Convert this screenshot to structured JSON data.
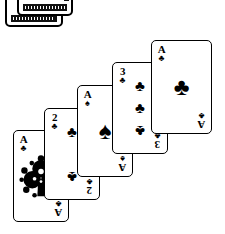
{
  "scene": {
    "title": "Fanned playing cards with deck box",
    "background_color": "#ffffff",
    "ink_color": "#000000",
    "style": "black-and-white line illustration"
  },
  "deck_box": {
    "name": "playing-card-deck-box",
    "description": "Two stacked card boxes at the top-left, cropped by the top image edge",
    "pip_glyphs": [
      "♣",
      "♣"
    ],
    "visible": true
  },
  "cards": [
    {
      "id": "card-1",
      "rank": "A",
      "suit": "clubs",
      "suit_glyph": "♣",
      "corner_rank": "A",
      "corner_suit": "♣",
      "pip_count": 1,
      "ornate": true,
      "position": {
        "left": 13,
        "top": 130,
        "width": 56,
        "height": 92
      },
      "z": 1
    },
    {
      "id": "card-2",
      "rank": "2",
      "suit": "clubs",
      "suit_glyph": "♣",
      "corner_rank": "2",
      "corner_suit": "♣",
      "pip_count": 2,
      "ornate": false,
      "position": {
        "left": 44,
        "top": 108,
        "width": 56,
        "height": 92
      },
      "z": 2
    },
    {
      "id": "card-3",
      "rank": "A",
      "suit": "spades",
      "suit_glyph": "♠",
      "corner_rank": "A",
      "corner_suit": "♠",
      "pip_count": 1,
      "ornate": false,
      "position": {
        "left": 77,
        "top": 85,
        "width": 56,
        "height": 92
      },
      "z": 3
    },
    {
      "id": "card-4",
      "rank": "3",
      "suit": "clubs",
      "suit_glyph": "♣",
      "corner_rank": "3",
      "corner_suit": "♣",
      "pip_count": 3,
      "ornate": false,
      "position": {
        "left": 112,
        "top": 62,
        "width": 56,
        "height": 92
      },
      "z": 4
    },
    {
      "id": "card-5",
      "rank": "A",
      "suit": "clubs",
      "suit_glyph": "♣",
      "corner_rank": "A",
      "corner_suit": "♣",
      "pip_count": 1,
      "ornate": false,
      "position": {
        "left": 151,
        "top": 40,
        "width": 61,
        "height": 94
      },
      "z": 5
    }
  ]
}
